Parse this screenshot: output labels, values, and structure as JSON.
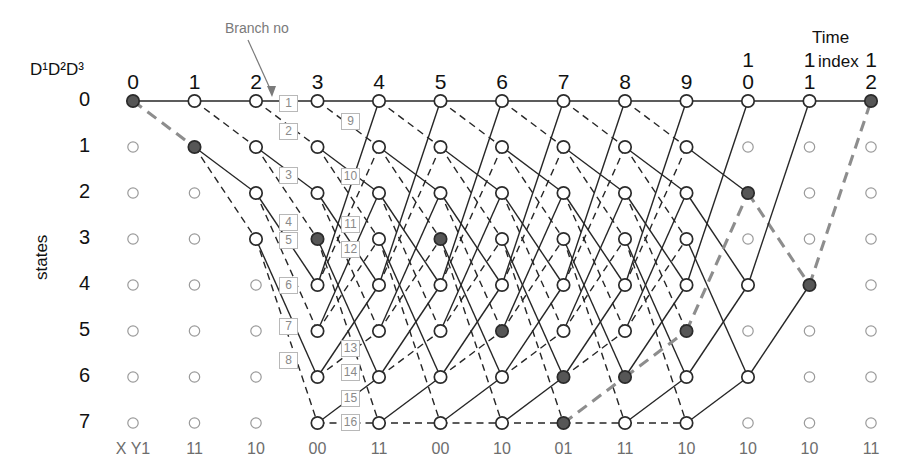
{
  "figure": {
    "type": "trellis-diagram",
    "title_annotation": "Branch no",
    "time_axis_label_word": "index",
    "time_axis_label_top": "Time",
    "states_axis_label": "states",
    "state_header": "D¹D²D³"
  },
  "time_indices": [
    {
      "top": "",
      "bot": "0"
    },
    {
      "top": "",
      "bot": "1"
    },
    {
      "top": "",
      "bot": "2"
    },
    {
      "top": "",
      "bot": "3"
    },
    {
      "top": "",
      "bot": "4"
    },
    {
      "top": "",
      "bot": "5"
    },
    {
      "top": "",
      "bot": "6"
    },
    {
      "top": "",
      "bot": "7"
    },
    {
      "top": "",
      "bot": "8"
    },
    {
      "top": "",
      "bot": "9"
    },
    {
      "top": "1",
      "bot": "0"
    },
    {
      "top": "1",
      "bot": "1"
    },
    {
      "top": "1",
      "bot": "2"
    }
  ],
  "states": [
    "0",
    "1",
    "2",
    "3",
    "4",
    "5",
    "6",
    "7"
  ],
  "bottom_labels": [
    "X Y1",
    "11",
    "10",
    "00",
    "11",
    "00",
    "10",
    "01",
    "11",
    "10",
    "10",
    "10",
    "11"
  ],
  "branch_numbers_col1": [
    "1",
    "2",
    "3",
    "4",
    "5",
    "6",
    "7",
    "8"
  ],
  "branch_numbers_col2": [
    "9",
    "10",
    "11",
    "12",
    "13",
    "14",
    "15",
    "16"
  ],
  "colors": {
    "node_stroke": "#2b2b2b",
    "node_fill_open": "#ffffff",
    "node_fill_closed": "#565656",
    "edge_solid": "#262626",
    "edge_dashed": "#262626",
    "path_highlight": "#8d8d8d",
    "label_gray": "#7a7a7a",
    "text": "#111111"
  },
  "chart_data": {
    "type": "diagram",
    "n_states": 8,
    "n_times": 13,
    "filled_nodes": [
      [
        0,
        0
      ],
      [
        1,
        1
      ],
      [
        3,
        3
      ],
      [
        6,
        5
      ],
      [
        7,
        6
      ],
      [
        5,
        3
      ],
      [
        7,
        7
      ],
      [
        8,
        6
      ],
      [
        9,
        5
      ],
      [
        10,
        2
      ],
      [
        11,
        4
      ],
      [
        12,
        0
      ]
    ],
    "survivor_path": [
      [
        0,
        0
      ],
      [
        1,
        1
      ],
      [
        3,
        3
      ],
      [
        5,
        3
      ],
      [
        6,
        5
      ],
      [
        7,
        6
      ],
      [
        7,
        7
      ],
      [
        8,
        6
      ],
      [
        9,
        5
      ],
      [
        10,
        2
      ],
      [
        11,
        4
      ],
      [
        12,
        0
      ]
    ]
  }
}
